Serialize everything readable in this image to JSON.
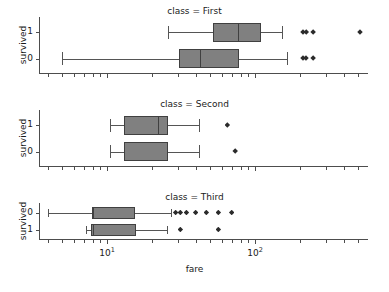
{
  "figure": {
    "xlabel": "fare",
    "ylabel": "survived",
    "x_scale": "log",
    "x_tick_labels": [
      {
        "text_mantissa": "10",
        "text_exponent": "1",
        "value": 10
      },
      {
        "text_mantissa": "10",
        "text_exponent": "2",
        "value": 100
      }
    ],
    "y_tick_labels_top": [
      "1",
      "0"
    ],
    "y_tick_labels_mid": [
      "1",
      "0"
    ],
    "y_tick_labels_bottom": [
      "0",
      "1"
    ],
    "box_fill_color": "#808080",
    "box_edge_color": "#404040",
    "flier_color": "#2b2b2b",
    "axis_color": "#4d4d4d"
  },
  "chart_data": {
    "type": "box",
    "title": "",
    "xlabel": "fare",
    "ylabel": "survived",
    "xscale": "log",
    "xlim": [
      4.0,
      600.0
    ],
    "grid": false,
    "legend": null,
    "facet_variable": "class",
    "group_variable": "survived",
    "panels": [
      {
        "title": "class = First",
        "facet_value": "First",
        "rows": [
          {
            "survived": "1",
            "whisker_low": 26.0,
            "q1": 52.0,
            "median": 77.0,
            "q3": 110.0,
            "whisker_high": 153.0,
            "fliers": [
              211.0,
              222.0,
              247.0,
              512.0
            ]
          },
          {
            "survived": "0",
            "whisker_low": 5.0,
            "q1": 30.7,
            "median": 42.4,
            "q3": 78.0,
            "whisker_high": 164.0,
            "fliers": [
              211.0,
              221.0,
              247.0
            ]
          }
        ]
      },
      {
        "title": "class = Second",
        "facet_value": "Second",
        "rows": [
          {
            "survived": "1",
            "whisker_low": 10.5,
            "q1": 13.0,
            "median": 22.0,
            "q3": 26.0,
            "whisker_high": 41.6,
            "fliers": [
              65.0
            ]
          },
          {
            "survived": "0",
            "whisker_low": 10.5,
            "q1": 13.0,
            "median": 13.0,
            "q3": 26.0,
            "whisker_high": 41.6,
            "fliers": [
              73.5
            ]
          }
        ]
      },
      {
        "title": "class = Third",
        "facet_value": "Third",
        "rows": [
          {
            "survived": "0",
            "whisker_low": 4.0,
            "q1": 7.9,
            "median": 8.05,
            "q3": 15.5,
            "whisker_high": 27.0,
            "fliers": [
              29.1,
              31.3,
              34.4,
              39.7,
              46.9,
              56.5,
              69.6
            ]
          },
          {
            "survived": "1",
            "whisker_low": 7.2,
            "q1": 7.8,
            "median": 8.0,
            "q3": 15.7,
            "whisker_high": 25.5,
            "fliers": [
              31.3,
              56.5
            ]
          }
        ]
      }
    ]
  }
}
